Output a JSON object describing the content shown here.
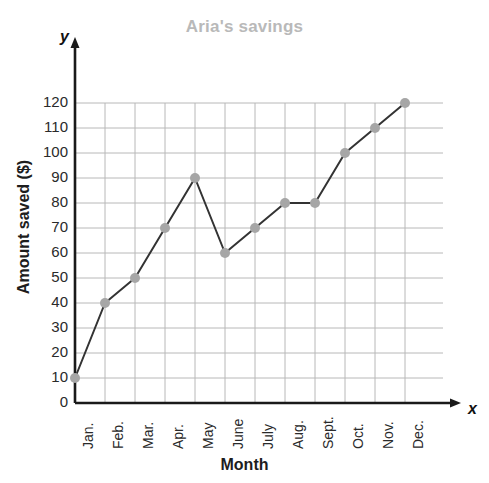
{
  "chart_data": {
    "type": "line",
    "title": "Aria's savings",
    "xlabel": "Month",
    "ylabel": "Amount saved ($)",
    "categories": [
      "Jan.",
      "Feb.",
      "Mar.",
      "Apr.",
      "May",
      "June",
      "July",
      "Aug.",
      "Sept.",
      "Oct.",
      "Nov.",
      "Dec."
    ],
    "values": [
      10,
      40,
      50,
      70,
      90,
      60,
      70,
      80,
      80,
      100,
      110,
      120
    ],
    "series": [
      {
        "name": "Amount saved ($)",
        "values": [
          10,
          40,
          50,
          70,
          90,
          60,
          70,
          80,
          80,
          100,
          110,
          120
        ]
      }
    ],
    "ylim": [
      0,
      120
    ],
    "ytick_labels": [
      "0",
      "10",
      "20",
      "30",
      "40",
      "50",
      "60",
      "70",
      "80",
      "90",
      "100",
      "110",
      "120"
    ],
    "ytick_values": [
      0,
      10,
      20,
      30,
      40,
      50,
      60,
      70,
      80,
      90,
      100,
      110,
      120
    ],
    "ytick_step": 10,
    "grid": true,
    "legend": "none",
    "axis_letters": {
      "y": "y",
      "x": "x"
    },
    "colors": {
      "title": "#b9b9b9",
      "line": "#333333",
      "marker": "#a6a6a6",
      "grid": "#b8b8b8",
      "axis": "#1a1a1a",
      "tick_text": "#2a2a2a",
      "background": "#ffffff"
    }
  }
}
